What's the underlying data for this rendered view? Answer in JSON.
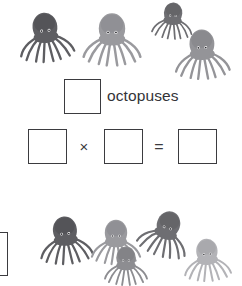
{
  "worksheet": {
    "background_color": "#ffffff",
    "subject_label": "octopuses",
    "count_box_value": "",
    "equation": {
      "operand_a": "",
      "multiply_symbol": "×",
      "operand_b": "",
      "equals_symbol": "=",
      "product": ""
    }
  },
  "groups": {
    "top": {
      "count": 4,
      "octopuses": [
        {
          "name": "octopus-top-1",
          "x": 14,
          "y": 2,
          "w": 62,
          "h": 74,
          "color": "#5e5e62",
          "shade": "#4a4a4e",
          "rot": -6,
          "scale": 1.0
        },
        {
          "name": "octopus-top-2",
          "x": 79,
          "y": 10,
          "w": 66,
          "h": 62,
          "color": "#9a9a9e",
          "shade": "#858589",
          "rot": 0,
          "scale": 1.0
        },
        {
          "name": "octopus-top-3",
          "x": 150,
          "y": 0,
          "w": 46,
          "h": 46,
          "color": "#6e6e72",
          "shade": "#5a5a5e",
          "rot": 4,
          "scale": 1.0
        },
        {
          "name": "octopus-top-4",
          "x": 168,
          "y": 28,
          "w": 68,
          "h": 56,
          "color": "#949498",
          "shade": "#7f7f83",
          "rot": -2,
          "scale": 1.0
        }
      ]
    },
    "bottom": {
      "count": 5,
      "octopuses": [
        {
          "name": "octopus-bottom-1",
          "x": 35,
          "y": 8,
          "w": 60,
          "h": 68,
          "color": "#5e5e62",
          "shade": "#4a4a4e",
          "rot": -5,
          "scale": 1.0
        },
        {
          "name": "octopus-bottom-2",
          "x": 88,
          "y": 18,
          "w": 56,
          "h": 52,
          "color": "#9a9a9e",
          "shade": "#858589",
          "rot": 0,
          "scale": 1.0
        },
        {
          "name": "octopus-bottom-3",
          "x": 139,
          "y": 6,
          "w": 58,
          "h": 60,
          "color": "#6e6e72",
          "shade": "#5a5a5e",
          "rot": 18,
          "scale": 1.0
        },
        {
          "name": "octopus-bottom-4",
          "x": 100,
          "y": 46,
          "w": 52,
          "h": 44,
          "color": "#8d8d91",
          "shade": "#78787c",
          "rot": 0,
          "scale": 1.0
        },
        {
          "name": "octopus-bottom-5",
          "x": 176,
          "y": 38,
          "w": 62,
          "h": 48,
          "color": "#b3b3b7",
          "shade": "#9e9ea2",
          "rot": -3,
          "scale": 1.0
        }
      ]
    }
  }
}
